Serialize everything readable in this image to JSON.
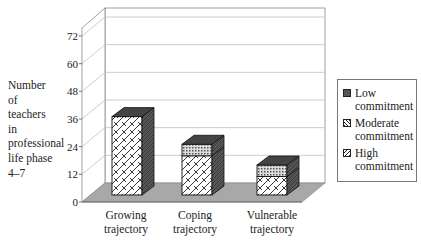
{
  "chart_data": {
    "type": "bar",
    "subtype": "stacked-3d",
    "title": "",
    "xlabel": "",
    "ylabel": "Number of teachers in professional life phase 4–7",
    "ylabel_lines": [
      "Number",
      "of",
      "teachers",
      "in",
      "professional",
      "life phase",
      " 4–7"
    ],
    "ylim": [
      0,
      72
    ],
    "yticks": [
      "0",
      "12",
      "24",
      "36",
      "48",
      "60",
      "72"
    ],
    "grid": true,
    "legend_position": "right",
    "categories": [
      "Growing trajectory",
      "Coping trajectory",
      "Vulnerable trajectory"
    ],
    "category_lines": [
      [
        "Growing",
        "trajectory"
      ],
      [
        "Coping",
        "trajectory"
      ],
      [
        "Vulnerable",
        "trajectory"
      ]
    ],
    "series": [
      {
        "name": "High commitment",
        "values": [
          34,
          17,
          8
        ],
        "pattern": "brick-hatch",
        "color": "#ffffff"
      },
      {
        "name": "Moderate commitment",
        "values": [
          0,
          5,
          5
        ],
        "pattern": "crosshatch",
        "color": "#bbbbbb"
      },
      {
        "name": "Low commitment",
        "values": [
          0,
          0,
          0
        ],
        "pattern": "solid",
        "color": "#555555"
      }
    ]
  },
  "legend": {
    "items": [
      {
        "lines": [
          "Low",
          "commitment"
        ],
        "swatch": "solid"
      },
      {
        "lines": [
          "Moderate",
          "commitment"
        ],
        "swatch": "crosshatch"
      },
      {
        "lines": [
          "High",
          "commitment"
        ],
        "swatch": "brick"
      }
    ]
  },
  "colors": {
    "floor": "#a8a8a8",
    "bar_side": "#555555",
    "bar_top": "#444444",
    "grid": "#bfbfbf",
    "axis": "#888888"
  }
}
